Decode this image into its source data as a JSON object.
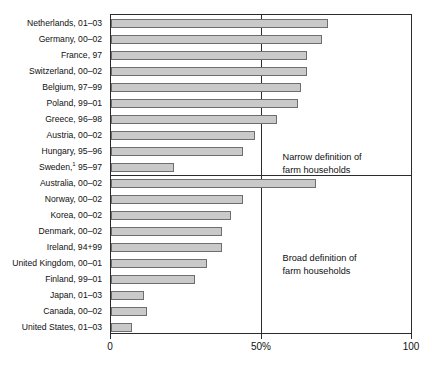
{
  "chart_data": {
    "type": "bar",
    "orientation": "horizontal",
    "title": "",
    "xlabel": "",
    "ylabel": "",
    "xlim": [
      0,
      100
    ],
    "grid": false,
    "legend": false,
    "xticks": [
      {
        "value": 0,
        "label": "0"
      },
      {
        "value": 50,
        "label": "50%"
      },
      {
        "value": 100,
        "label": "100"
      }
    ],
    "categories": [
      "Netherlands, 01–03",
      "Germany, 00–02",
      "France, 97",
      "Switzerland, 00–02",
      "Belgium, 97–99",
      "Poland, 99–01",
      "Greece, 96–98",
      "Austria, 00–02",
      "Hungary, 95–96",
      "Sweden,¹ 95–97",
      "Australia, 00–02",
      "Norway, 00–02",
      "Korea, 00–02",
      "Denmark, 00–02",
      "Ireland, 94+99",
      "United Kingdom, 00–01",
      "Finland, 99–01",
      "Japan, 01–03",
      "Canada, 00–02",
      "United States, 01–03"
    ],
    "values": [
      72,
      70,
      65,
      65,
      63,
      62,
      55,
      48,
      44,
      21,
      68,
      44,
      40,
      37,
      37,
      32,
      28,
      11,
      12,
      7
    ],
    "bars": [
      {
        "label": "Netherlands, 01–03",
        "label_base": "Netherlands,",
        "label_suffix": "01–03",
        "value": 72,
        "group": "narrow"
      },
      {
        "label": "Germany, 00–02",
        "label_base": "Germany,",
        "label_suffix": "00–02",
        "value": 70,
        "group": "narrow"
      },
      {
        "label": "France, 97",
        "label_base": "France,",
        "label_suffix": "97",
        "value": 65,
        "group": "narrow"
      },
      {
        "label": "Switzerland, 00–02",
        "label_base": "Switzerland,",
        "label_suffix": "00–02",
        "value": 65,
        "group": "narrow"
      },
      {
        "label": "Belgium, 97–99",
        "label_base": "Belgium,",
        "label_suffix": "97–99",
        "value": 63,
        "group": "narrow"
      },
      {
        "label": "Poland, 99–01",
        "label_base": "Poland,",
        "label_suffix": "99–01",
        "value": 62,
        "group": "narrow"
      },
      {
        "label": "Greece, 96–98",
        "label_base": "Greece,",
        "label_suffix": "96–98",
        "value": 55,
        "group": "narrow"
      },
      {
        "label": "Austria, 00–02",
        "label_base": "Austria,",
        "label_suffix": "00–02",
        "value": 48,
        "group": "narrow"
      },
      {
        "label": "Hungary, 95–96",
        "label_base": "Hungary,",
        "label_suffix": "95–96",
        "value": 44,
        "group": "narrow"
      },
      {
        "label": "Sweden,¹ 95–97",
        "label_base": "Sweden,",
        "label_suffix": "95–97",
        "footnote": "1",
        "value": 21,
        "group": "narrow"
      },
      {
        "label": "Australia, 00–02",
        "label_base": "Australia,",
        "label_suffix": "00–02",
        "value": 68,
        "group": "broad"
      },
      {
        "label": "Norway, 00–02",
        "label_base": "Norway,",
        "label_suffix": "00–02",
        "value": 44,
        "group": "broad"
      },
      {
        "label": "Korea, 00–02",
        "label_base": "Korea,",
        "label_suffix": "00–02",
        "value": 40,
        "group": "broad"
      },
      {
        "label": "Denmark, 00–02",
        "label_base": "Denmark,",
        "label_suffix": "00–02",
        "value": 37,
        "group": "broad"
      },
      {
        "label": "Ireland, 94+99",
        "label_base": "Ireland,",
        "label_suffix": "94+99",
        "value": 37,
        "group": "broad"
      },
      {
        "label": "United Kingdom, 00–01",
        "label_base": "United Kingdom,",
        "label_suffix": "00–01",
        "value": 32,
        "group": "broad"
      },
      {
        "label": "Finland, 99–01",
        "label_base": "Finland,",
        "label_suffix": "99–01",
        "value": 28,
        "group": "broad"
      },
      {
        "label": "Japan, 01–03",
        "label_base": "Japan,",
        "label_suffix": "01–03",
        "value": 11,
        "group": "broad"
      },
      {
        "label": "Canada, 00–02",
        "label_base": "Canada,",
        "label_suffix": "00–02",
        "value": 12,
        "group": "broad"
      },
      {
        "label": "United States, 01–03",
        "label_base": "United States,",
        "label_suffix": "01–03",
        "value": 7,
        "group": "broad"
      }
    ],
    "annotations": [
      {
        "id": "narrow",
        "text": "Narrow definition of\nfarm households",
        "after_row": 9
      },
      {
        "id": "broad",
        "text": "Broad definition of\nfarm households",
        "after_row": 19
      }
    ],
    "reference_line": {
      "value": 50,
      "label": "50%"
    },
    "section_break_after_row": 9,
    "colors": {
      "bar_fill": "#c9c9c9",
      "bar_stroke": "#6e6e6e",
      "axis": "#2b2b2b",
      "text": "#111111",
      "background": "#ffffff"
    }
  }
}
